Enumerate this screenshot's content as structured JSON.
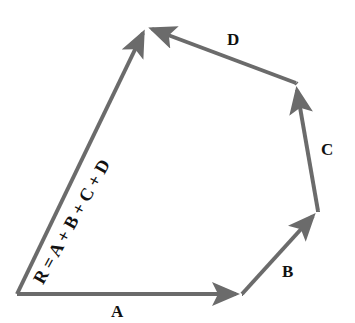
{
  "diagram": {
    "type": "vector-addition-polygon",
    "vectors": [
      {
        "name": "A",
        "label": "A",
        "from": [
          17,
          294
        ],
        "to": [
          242,
          294
        ]
      },
      {
        "name": "B",
        "label": "B",
        "from": [
          242,
          294
        ],
        "to": [
          318,
          211
        ]
      },
      {
        "name": "C",
        "label": "C",
        "from": [
          318,
          211
        ],
        "to": [
          296,
          83
        ]
      },
      {
        "name": "D",
        "label": "D",
        "from": [
          296,
          83
        ],
        "to": [
          146,
          27
        ]
      },
      {
        "name": "R",
        "label": "R = A + B + C + D",
        "from": [
          17,
          294
        ],
        "to": [
          146,
          27
        ]
      }
    ],
    "colors": {
      "vector": "#6b6b6b",
      "text": "#111111"
    }
  }
}
